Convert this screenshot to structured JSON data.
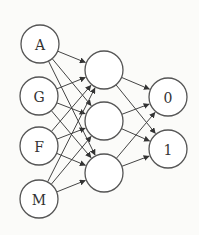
{
  "diagram": {
    "type": "neural-network",
    "colors": {
      "stroke": "#555555",
      "fill": "#ffffff",
      "text": "#333333",
      "background": "#fbfbf9"
    },
    "layers": {
      "input": [
        {
          "id": "A",
          "label": "A",
          "x": 40,
          "y": 44
        },
        {
          "id": "G",
          "label": "G",
          "x": 39,
          "y": 96
        },
        {
          "id": "F",
          "label": "F",
          "x": 39,
          "y": 146
        },
        {
          "id": "M",
          "label": "M",
          "x": 39,
          "y": 199
        }
      ],
      "hidden": [
        {
          "id": "h1",
          "label": "",
          "x": 104,
          "y": 70
        },
        {
          "id": "h2",
          "label": "",
          "x": 104,
          "y": 121
        },
        {
          "id": "h3",
          "label": "",
          "x": 104,
          "y": 173
        }
      ],
      "output": [
        {
          "id": "o0",
          "label": "0",
          "x": 168,
          "y": 97
        },
        {
          "id": "o1",
          "label": "1",
          "x": 168,
          "y": 149
        }
      ]
    },
    "radius": 19,
    "edges": "fully-connected input->hidden, hidden->output"
  }
}
